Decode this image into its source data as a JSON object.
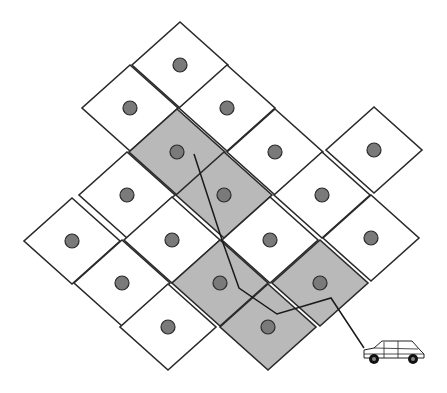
{
  "diagram": {
    "colors": {
      "background": "#ffffff",
      "cell_fill": "#ffffff",
      "cell_shaded_fill": "#b9b9b9",
      "cell_stroke": "#2a2a2a",
      "dot_fill": "#7a7a7a",
      "dot_stroke": "#2a2a2a",
      "route_stroke": "#1a1a1a"
    },
    "cell_half_diagonal": {
      "dx": 48,
      "dy": 44
    },
    "cells": [
      {
        "cx": 180,
        "cy": 65,
        "shaded": false
      },
      {
        "cx": 130,
        "cy": 108,
        "shaded": false
      },
      {
        "cx": 227,
        "cy": 108,
        "shaded": false
      },
      {
        "cx": 177,
        "cy": 152,
        "shaded": true
      },
      {
        "cx": 275,
        "cy": 152,
        "shaded": false
      },
      {
        "cx": 374,
        "cy": 150,
        "shaded": false
      },
      {
        "cx": 127,
        "cy": 195,
        "shaded": false
      },
      {
        "cx": 224,
        "cy": 195,
        "shaded": true
      },
      {
        "cx": 322,
        "cy": 195,
        "shaded": false
      },
      {
        "cx": 72,
        "cy": 241,
        "shaded": false
      },
      {
        "cx": 172,
        "cy": 240,
        "shaded": false
      },
      {
        "cx": 270,
        "cy": 240,
        "shaded": false
      },
      {
        "cx": 371,
        "cy": 238,
        "shaded": false
      },
      {
        "cx": 122,
        "cy": 283,
        "shaded": false
      },
      {
        "cx": 220,
        "cy": 283,
        "shaded": true
      },
      {
        "cx": 320,
        "cy": 283,
        "shaded": true
      },
      {
        "cx": 168,
        "cy": 327,
        "shaded": false
      },
      {
        "cx": 268,
        "cy": 327,
        "shaded": true
      }
    ],
    "route": {
      "points": [
        [
          194,
          154
        ],
        [
          222,
          240
        ],
        [
          239,
          288
        ],
        [
          277,
          314
        ],
        [
          331,
          298
        ],
        [
          364,
          348
        ]
      ]
    },
    "car": {
      "x": 362,
      "y": 338,
      "label": "vehicle",
      "icon": "car-icon"
    }
  }
}
